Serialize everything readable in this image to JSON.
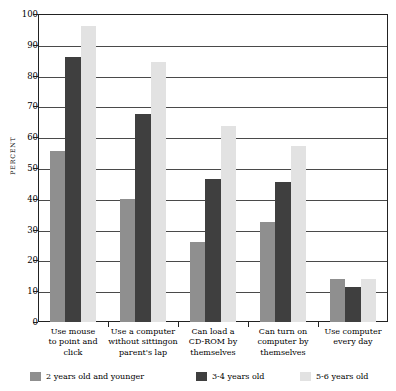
{
  "chart_data": {
    "type": "bar",
    "title": "",
    "xlabel": "",
    "ylabel": "PERCENT",
    "ylim": [
      0,
      100
    ],
    "ytick_step": 10,
    "yticks": [
      0,
      10,
      20,
      30,
      40,
      50,
      60,
      70,
      80,
      90,
      100
    ],
    "grid": true,
    "legend_position": "bottom",
    "categories": [
      "Use mouse to point and click",
      "Use a computer without sittingon parent's lap",
      "Can load a CD-ROM by themselves",
      "Can turn on computer by themselves",
      "Use computer every day"
    ],
    "category_lines": [
      [
        "Use mouse",
        "to point and",
        "click"
      ],
      [
        "Use a computer",
        "without sittingon",
        "parent's lap"
      ],
      [
        "Can load a",
        "CD-ROM by",
        "themselves"
      ],
      [
        "Can turn on",
        "computer by",
        "themselves"
      ],
      [
        "Use computer",
        "every day"
      ]
    ],
    "series": [
      {
        "name": "2 years old and younger",
        "color": "#8f8f8f",
        "values": [
          55.5,
          40.0,
          26.0,
          32.5,
          14.0
        ]
      },
      {
        "name": "3-4 years old",
        "color": "#3f3f3f",
        "values": [
          86.0,
          67.5,
          46.5,
          45.5,
          11.5
        ]
      },
      {
        "name": "5-6 years old",
        "color": "#e2e2e2",
        "values": [
          96.0,
          84.5,
          63.5,
          57.0,
          14.0
        ]
      }
    ]
  },
  "axis": {
    "y_title": "PERCENT"
  }
}
